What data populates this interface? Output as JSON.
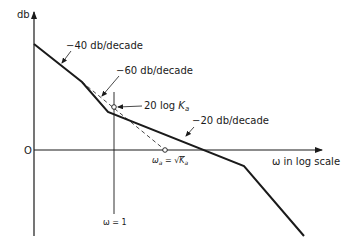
{
  "diagram": {
    "type": "bode-magnitude-asymptotic-plot",
    "axes": {
      "y_label": "db",
      "x_label": "ω in log scale",
      "origin_label": "O"
    },
    "slope_labels": [
      {
        "text": "−40 db/decade"
      },
      {
        "text": "−60 db/decade"
      },
      {
        "text": "−20 db/decade"
      }
    ],
    "annotations": {
      "gain_label_prefix": "20 log ",
      "gain_label_var": "K",
      "gain_label_sub": "a",
      "crossover_label_prefix": "ω",
      "crossover_label_sub": "a",
      "crossover_label_eq": " = √",
      "crossover_label_var": "K",
      "crossover_label_var_sub": "a",
      "unity_freq_label": "ω = 1"
    },
    "colors": {
      "line": "#1a1a1a",
      "background": "#ffffff"
    }
  }
}
